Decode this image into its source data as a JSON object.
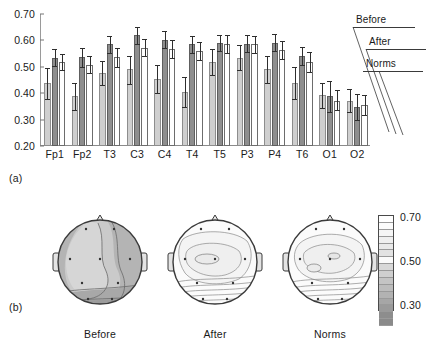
{
  "figure": {
    "panel_a_tag": "(a)",
    "panel_b_tag": "(b)"
  },
  "chart_data": {
    "type": "bar",
    "title": "",
    "xlabel": "",
    "ylabel": "",
    "ylim": [
      0.2,
      0.7
    ],
    "yticks": [
      "0.70",
      "0.60",
      "0.50",
      "0.40",
      "0.30",
      "0.20"
    ],
    "ytick_values": [
      0.7,
      0.6,
      0.5,
      0.4,
      0.3,
      0.2
    ],
    "grid": false,
    "legend_position": "upper-right",
    "categories": [
      "Fp1",
      "Fp2",
      "T3",
      "C3",
      "C4",
      "T4",
      "T5",
      "P3",
      "P4",
      "T6",
      "O1",
      "O2"
    ],
    "series": [
      {
        "name": "Before",
        "color": "#cfcfcf",
        "values": [
          0.438,
          0.388,
          0.477,
          0.49,
          0.455,
          0.405,
          0.518,
          0.535,
          0.49,
          0.44,
          0.392,
          0.372
        ],
        "err_low": [
          0.378,
          0.335,
          0.43,
          0.435,
          0.402,
          0.348,
          0.468,
          0.487,
          0.44,
          0.378,
          0.345,
          0.33
        ],
        "err_high": [
          0.497,
          0.44,
          0.522,
          0.542,
          0.508,
          0.462,
          0.568,
          0.583,
          0.54,
          0.5,
          0.438,
          0.415
        ]
      },
      {
        "name": "After",
        "color": "#8e8e8e",
        "values": [
          0.535,
          0.536,
          0.585,
          0.62,
          0.603,
          0.585,
          0.59,
          0.588,
          0.592,
          0.54,
          0.388,
          0.348
        ],
        "err_low": [
          0.503,
          0.5,
          0.553,
          0.588,
          0.572,
          0.552,
          0.56,
          0.556,
          0.56,
          0.505,
          0.33,
          0.3
        ],
        "err_high": [
          0.568,
          0.57,
          0.617,
          0.652,
          0.635,
          0.618,
          0.622,
          0.62,
          0.625,
          0.575,
          0.445,
          0.398
        ]
      },
      {
        "name": "Norms",
        "color": "#ffffff",
        "values": [
          0.518,
          0.508,
          0.537,
          0.572,
          0.568,
          0.56,
          0.585,
          0.585,
          0.563,
          0.518,
          0.372,
          0.355
        ],
        "err_low": [
          0.487,
          0.476,
          0.5,
          0.54,
          0.532,
          0.527,
          0.552,
          0.552,
          0.53,
          0.482,
          0.335,
          0.318
        ],
        "err_high": [
          0.55,
          0.54,
          0.572,
          0.605,
          0.602,
          0.595,
          0.62,
          0.618,
          0.598,
          0.555,
          0.412,
          0.392
        ]
      }
    ],
    "legend_entries": [
      "Before",
      "After",
      "Norms"
    ]
  },
  "topomaps": {
    "maps": [
      {
        "caption": "Before"
      },
      {
        "caption": "After"
      },
      {
        "caption": "Norms"
      }
    ],
    "colorbar": {
      "max_label": "0.70",
      "mid_label": "0.50",
      "min_label": "0.30",
      "max_value": 0.7,
      "mid_value": 0.5,
      "min_value": 0.3,
      "segments": [
        "#ffffff",
        "#fbfbfb",
        "#f5f5f5",
        "#efefef",
        "#e9e9e9",
        "#e2e2e2",
        "#fafafa",
        "#d8d8d8",
        "#cfcfcf",
        "#c4c4c4",
        "#bcbcbc",
        "#b2b2b2",
        "#a6a6a6",
        "#9a9a9a",
        "#8d8d8d",
        "#8a8a8a"
      ]
    }
  }
}
